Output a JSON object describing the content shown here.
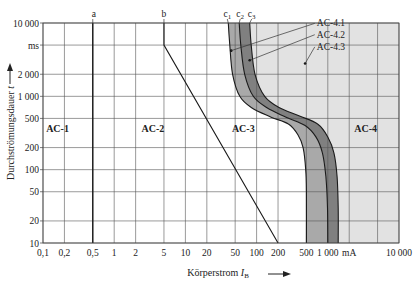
{
  "chart_data": {
    "type": "line",
    "title": "",
    "xlabel": "Körperstrom I_B",
    "xlabel_main": "Körperstrom ",
    "xlabel_symbol": "I",
    "xlabel_sub": "B",
    "ylabel": "Durchströmungsdauer t",
    "ylabel_main": "Durchströmungsdauer ",
    "ylabel_symbol": "t",
    "x_unit": "mA",
    "y_unit": "ms",
    "xscale": "log",
    "yscale": "log",
    "xlim": [
      0.1,
      10000
    ],
    "ylim": [
      10,
      10000
    ],
    "grid": true,
    "x_ticks": [
      {
        "value": 0.1,
        "label": "0,1"
      },
      {
        "value": 0.2,
        "label": "0,2"
      },
      {
        "value": 0.5,
        "label": "0,5"
      },
      {
        "value": 1,
        "label": "1"
      },
      {
        "value": 2,
        "label": "2"
      },
      {
        "value": 5,
        "label": "5"
      },
      {
        "value": 10,
        "label": "10"
      },
      {
        "value": 20,
        "label": "20"
      },
      {
        "value": 50,
        "label": "50"
      },
      {
        "value": 100,
        "label": "100"
      },
      {
        "value": 200,
        "label": "200"
      },
      {
        "value": 500,
        "label": "500"
      },
      {
        "value": 1000,
        "label": "1 000"
      },
      {
        "value": 2000,
        "label": "mA"
      },
      {
        "value": 5000,
        "label": ""
      },
      {
        "value": 10000,
        "label": "10 000"
      }
    ],
    "y_ticks": [
      {
        "value": 10,
        "label": "10"
      },
      {
        "value": 20,
        "label": "20"
      },
      {
        "value": 50,
        "label": "50"
      },
      {
        "value": 100,
        "label": "100"
      },
      {
        "value": 200,
        "label": "200"
      },
      {
        "value": 500,
        "label": "500"
      },
      {
        "value": 1000,
        "label": "1 000"
      },
      {
        "value": 2000,
        "label": "2 000"
      },
      {
        "value": 5000,
        "label": "ms"
      },
      {
        "value": 10000,
        "label": "10 000"
      }
    ],
    "series": [
      {
        "name": "a",
        "label": "a",
        "points": [
          [
            0.5,
            10
          ],
          [
            0.5,
            10000
          ]
        ]
      },
      {
        "name": "b",
        "label": "b",
        "points": [
          [
            5,
            10000
          ],
          [
            5,
            5000
          ],
          [
            200,
            10
          ]
        ]
      },
      {
        "name": "c1",
        "label": "c",
        "sub": "1",
        "points": [
          [
            40,
            10000
          ],
          [
            42,
            5000
          ],
          [
            46,
            2000
          ],
          [
            58,
            1000
          ],
          [
            85,
            700
          ],
          [
            160,
            520
          ],
          [
            280,
            420
          ],
          [
            380,
            300
          ],
          [
            450,
            200
          ],
          [
            490,
            100
          ],
          [
            500,
            50
          ],
          [
            500,
            10
          ]
        ]
      },
      {
        "name": "c2",
        "label": "c",
        "sub": "2",
        "points": [
          [
            57,
            10000
          ],
          [
            60,
            5000
          ],
          [
            68,
            2000
          ],
          [
            90,
            1000
          ],
          [
            140,
            700
          ],
          [
            260,
            520
          ],
          [
            480,
            400
          ],
          [
            680,
            280
          ],
          [
            840,
            170
          ],
          [
            940,
            80
          ],
          [
            990,
            30
          ],
          [
            1000,
            10
          ]
        ]
      },
      {
        "name": "c3",
        "label": "c",
        "sub": "3",
        "points": [
          [
            80,
            10000
          ],
          [
            84,
            5000
          ],
          [
            95,
            2000
          ],
          [
            130,
            1000
          ],
          [
            210,
            700
          ],
          [
            400,
            540
          ],
          [
            720,
            420
          ],
          [
            1000,
            280
          ],
          [
            1220,
            170
          ],
          [
            1350,
            80
          ],
          [
            1400,
            30
          ],
          [
            1400,
            10
          ]
        ]
      }
    ],
    "zones": [
      {
        "name": "AC-1",
        "x": 0.16,
        "y": 330
      },
      {
        "name": "AC-2",
        "x": 3.5,
        "y": 330
      },
      {
        "name": "AC-3",
        "x": 65,
        "y": 330
      },
      {
        "name": "AC-4",
        "x": 3400,
        "y": 330
      }
    ],
    "annotations": [
      {
        "text": "AC-4.1",
        "marker": [
          44,
          4200
        ],
        "label": [
          700,
          9000
        ]
      },
      {
        "text": "AC-4.2",
        "marker": [
          80,
          3100
        ],
        "label": [
          700,
          6300
        ]
      },
      {
        "text": "AC-4.3",
        "marker": [
          480,
          2800
        ],
        "label": [
          700,
          4300
        ]
      }
    ],
    "colors": {
      "ac4_region": "#e2e2e2",
      "band_c1_c2": "#a9a9a9",
      "band_c2_c3": "#808080",
      "grid": "#555555",
      "line": "#1a1a1a"
    }
  }
}
